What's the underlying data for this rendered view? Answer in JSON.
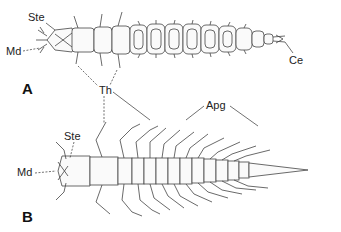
{
  "figure": {
    "panels": [
      {
        "id": "A",
        "label": "A",
        "description": "Larva, dorsal view (elongate, segmented, setose)",
        "annotations": {
          "ste": "Ste",
          "md": "Md",
          "ce": "Ce"
        }
      },
      {
        "id": "B",
        "label": "B",
        "description": "Larva, dorsal view with paired appendages and tapering caudal process",
        "annotations": {
          "ste": "Ste",
          "md": "Md",
          "apg": "Apg"
        }
      }
    ],
    "shared_annotations": {
      "th": "Th"
    },
    "colors": {
      "ink": "#333333",
      "background": "#ffffff"
    }
  }
}
